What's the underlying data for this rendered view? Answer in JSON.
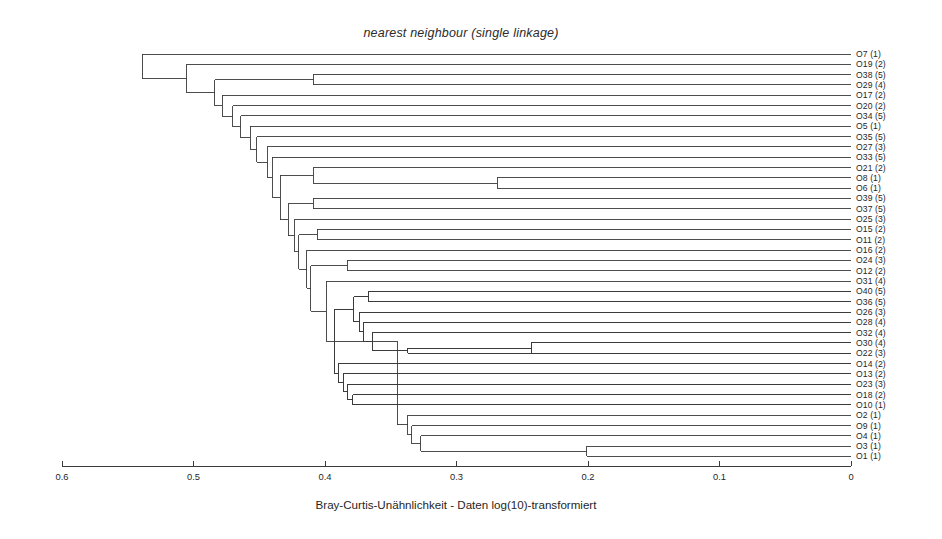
{
  "chart_data": {
    "type": "dendrogram",
    "title": "nearest neighbour (single linkage)",
    "xlabel": "Bray-Curtis-Unähnlichkeit - Daten log(10)-transformiert",
    "ylabel": "",
    "xlim": [
      0.6,
      0.0
    ],
    "x_axis_reversed": true,
    "grid": false,
    "legend": null,
    "linkage_method": "single linkage (nearest neighbour)",
    "distance_measure": "Bray-Curtis dissimilarity",
    "data_transform": "log(10)",
    "xticks": [
      0.6,
      0.5,
      0.4,
      0.3,
      0.2,
      0.1,
      0.0
    ],
    "xticklabels": [
      "0.6",
      "0.5",
      "0.4",
      "0.3",
      "0.2",
      "0.1",
      "0"
    ],
    "n_leaves": 40,
    "leaf_labels": [
      "O7 (1)",
      "O19 (2)",
      "O38 (5)",
      "O29 (4)",
      "O17 (2)",
      "O20 (2)",
      "O34 (5)",
      "O5 (1)",
      "O35 (5)",
      "O27 (3)",
      "O33 (5)",
      "O21 (2)",
      "O8 (1)",
      "O6 (1)",
      "O39 (5)",
      "O37 (5)",
      "O25 (3)",
      "O15 (2)",
      "O11 (2)",
      "O16 (2)",
      "O24 (3)",
      "O12 (2)",
      "O31 (4)",
      "O40 (5)",
      "O36 (5)",
      "O26 (3)",
      "O28 (4)",
      "O32 (4)",
      "O30 (4)",
      "O22 (3)",
      "O14 (2)",
      "O13 (2)",
      "O23 (3)",
      "O18 (2)",
      "O10 (1)",
      "O2 (1)",
      "O9 (1)",
      "O4 (1)",
      "O3 (1)",
      "O1 (1)"
    ],
    "leaf_order": [
      "O7",
      "O19",
      "O38",
      "O29",
      "O17",
      "O20",
      "O34",
      "O5",
      "O35",
      "O27",
      "O33",
      "O21",
      "O8",
      "O6",
      "O39",
      "O37",
      "O25",
      "O15",
      "O11",
      "O16",
      "O24",
      "O12",
      "O31",
      "O40",
      "O36",
      "O26",
      "O28",
      "O32",
      "O30",
      "O22",
      "O14",
      "O13",
      "O23",
      "O18",
      "O10",
      "O2",
      "O9",
      "O4",
      "O3",
      "O1"
    ],
    "merges": [
      {
        "id": "m1",
        "height": 0.539,
        "left": "O7",
        "right": "m2"
      },
      {
        "id": "m2",
        "height": 0.505,
        "left": "O19",
        "right": "m3"
      },
      {
        "id": "m3",
        "height": 0.484,
        "left": "m4",
        "right": "m5"
      },
      {
        "id": "m4",
        "height": 0.409,
        "left": "O38",
        "right": "O29"
      },
      {
        "id": "m5",
        "height": 0.478,
        "left": "O17",
        "right": "m6"
      },
      {
        "id": "m6",
        "height": 0.47,
        "left": "O20",
        "right": "m7"
      },
      {
        "id": "m7",
        "height": 0.464,
        "left": "O34",
        "right": "m8"
      },
      {
        "id": "m8",
        "height": 0.457,
        "left": "O5",
        "right": "m9"
      },
      {
        "id": "m9",
        "height": 0.452,
        "left": "O35",
        "right": "m10"
      },
      {
        "id": "m10",
        "height": 0.444,
        "left": "O27",
        "right": "m11"
      },
      {
        "id": "m11",
        "height": 0.44,
        "left": "O33",
        "right": "m12"
      },
      {
        "id": "m12",
        "height": 0.434,
        "left": "m13",
        "right": "m14"
      },
      {
        "id": "m13",
        "height": 0.409,
        "left": "O21",
        "right": "m31"
      },
      {
        "id": "m31",
        "height": 0.269,
        "left": "O8",
        "right": "O6"
      },
      {
        "id": "m14",
        "height": 0.428,
        "left": "m15",
        "right": "m16"
      },
      {
        "id": "m15",
        "height": 0.409,
        "left": "O39",
        "right": "O37"
      },
      {
        "id": "m16",
        "height": 0.423,
        "left": "O25",
        "right": "m17"
      },
      {
        "id": "m17",
        "height": 0.42,
        "left": "m18",
        "right": "m19"
      },
      {
        "id": "m18",
        "height": 0.406,
        "left": "O15",
        "right": "O11"
      },
      {
        "id": "m19",
        "height": 0.414,
        "left": "O16",
        "right": "m20"
      },
      {
        "id": "m20",
        "height": 0.411,
        "left": "m21",
        "right": "m22"
      },
      {
        "id": "m21",
        "height": 0.383,
        "left": "O24",
        "right": "O12"
      },
      {
        "id": "m22",
        "height": 0.399,
        "left": "O31",
        "right": "m23"
      },
      {
        "id": "m23",
        "height": 0.393,
        "left": "m24",
        "right": "m32"
      },
      {
        "id": "m24",
        "height": 0.378,
        "left": "m25",
        "right": "m26"
      },
      {
        "id": "m25",
        "height": 0.367,
        "left": "O40",
        "right": "O36"
      },
      {
        "id": "m26",
        "height": 0.374,
        "left": "O26",
        "right": "m27"
      },
      {
        "id": "m27",
        "height": 0.371,
        "left": "O28",
        "right": "m28"
      },
      {
        "id": "m28",
        "height": 0.364,
        "left": "O32",
        "right": "m29"
      },
      {
        "id": "m29",
        "height": 0.337,
        "left": "m30",
        "right": "O22"
      },
      {
        "id": "m30",
        "height": 0.243,
        "left": "O30",
        "right": "O22b"
      },
      {
        "id": "m32",
        "height": 0.39,
        "left": "O14",
        "right": "m33"
      },
      {
        "id": "m33",
        "height": 0.386,
        "left": "O13",
        "right": "m34"
      },
      {
        "id": "m34",
        "height": 0.383,
        "left": "O23",
        "right": "m35"
      },
      {
        "id": "m35",
        "height": 0.379,
        "left": "O18",
        "right": "O10"
      },
      {
        "id": "m36",
        "height": 0.345,
        "left": "m23",
        "right": "m37"
      },
      {
        "id": "m37",
        "height": 0.337,
        "left": "O2",
        "right": "m38"
      },
      {
        "id": "m38",
        "height": 0.334,
        "left": "O9",
        "right": "m39"
      },
      {
        "id": "m39",
        "height": 0.327,
        "left": "O4",
        "right": "m40"
      },
      {
        "id": "m40",
        "height": 0.201,
        "left": "O3",
        "right": "O1"
      }
    ],
    "colors": {
      "line": "#3a3a3a",
      "axis": "#3a3a3a",
      "text": "#1f1f1f",
      "background": "#ffffff"
    }
  },
  "geometry": {
    "x_at_0_6": 62,
    "x_at_0": 851,
    "first_leaf_y": 54,
    "leaf_spacing": 10.32,
    "axis_y": 466,
    "label_x": 856
  }
}
